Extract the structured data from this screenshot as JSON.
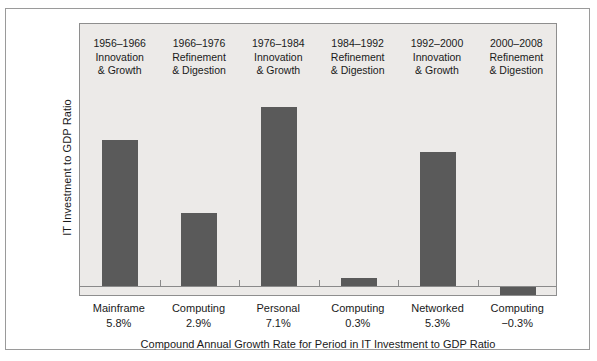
{
  "chart_data": {
    "type": "bar",
    "title": "",
    "xlabel": "Compound Annual Growth Rate for Period in IT Investment to GDP Ratio",
    "ylabel": "IT Investment to GDP Ratio",
    "grid": false,
    "legend": "none",
    "categories": [
      "Mainframe 5.8%",
      "Computing 2.9%",
      "Personal 7.1%",
      "Computing 0.3%",
      "Networked 5.3%",
      "Computing −0.3%"
    ],
    "values": [
      5.8,
      2.9,
      7.1,
      0.3,
      5.3,
      -0.3
    ],
    "value_labels": [
      "5.8%",
      "2.9%",
      "7.1%",
      "0.3%",
      "5.3%",
      "−0.3%"
    ],
    "ylim": [
      -0.4,
      8.0
    ],
    "bar_color": "#5a5a5a",
    "panel_color": "#eceae8",
    "axis_color": "#8a8a8a",
    "bars": [
      {
        "era_years": "1956–1966",
        "era_line1": "Innovation",
        "era_line2": "& Growth",
        "name_line": "Mainframe",
        "value_line": "5.8%",
        "value": 5.8
      },
      {
        "era_years": "1966–1976",
        "era_line1": "Refinement",
        "era_line2": "& Digestion",
        "name_line": "Computing",
        "value_line": "2.9%",
        "value": 2.9
      },
      {
        "era_years": "1976–1984",
        "era_line1": "Innovation",
        "era_line2": "& Growth",
        "name_line": "Personal",
        "value_line": "7.1%",
        "value": 7.1
      },
      {
        "era_years": "1984–1992",
        "era_line1": "Refinement",
        "era_line2": "& Digestion",
        "name_line": "Computing",
        "value_line": "0.3%",
        "value": 0.3
      },
      {
        "era_years": "1992–2000",
        "era_line1": "Innovation",
        "era_line2": "& Growth",
        "name_line": "Networked",
        "value_line": "5.3%",
        "value": 5.3
      },
      {
        "era_years": "2000–2008",
        "era_line1": "Refinement",
        "era_line2": "& Digestion",
        "name_line": "Computing",
        "value_line": "−0.3%",
        "value": -0.3
      }
    ]
  }
}
